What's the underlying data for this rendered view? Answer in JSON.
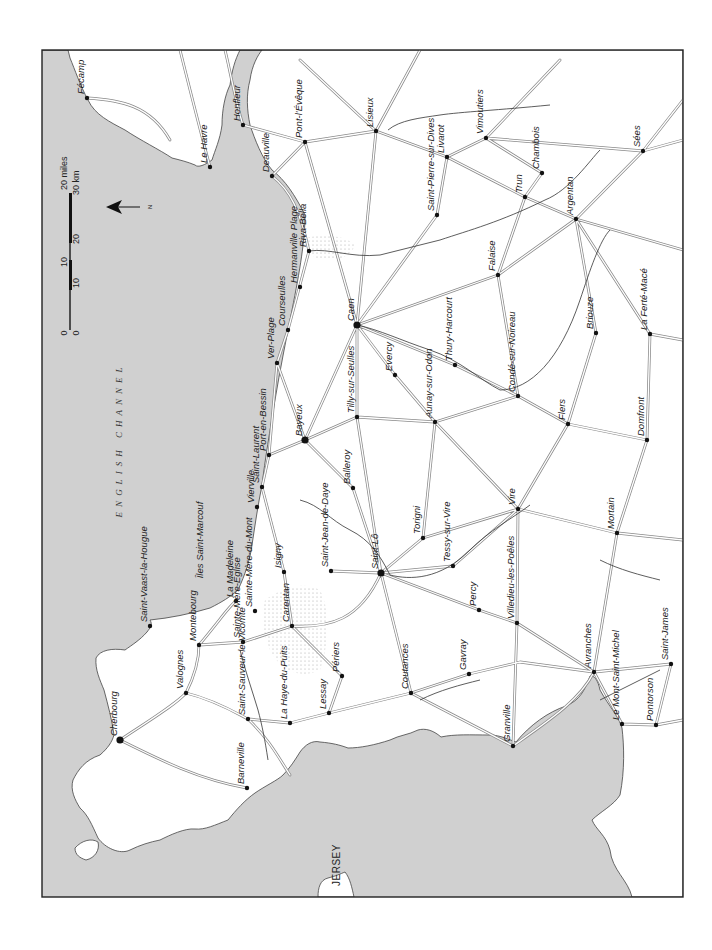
{
  "map": {
    "title": "Normandy",
    "orientation": "rotated 90 degrees; north arrow points left",
    "colors": {
      "sea": "#d0d0d0",
      "land": "#ffffff",
      "frame": "#222222",
      "road": "#8a8a8a",
      "river": "#333333"
    },
    "sea_label": "ENGLISH CHANNEL",
    "island_label": "JERSEY",
    "islands_small": "Îles Saint-Marcouf",
    "north_arrow": {
      "label": "N"
    },
    "scale_bar": {
      "miles_label": "20 miles",
      "km_label": "30 km",
      "miles_ticks": [
        "0",
        "10",
        "20"
      ],
      "km_ticks": [
        "0",
        "10",
        "20",
        "30"
      ]
    },
    "towns": [
      {
        "name": "Fécamp",
        "x": 87,
        "y": 98
      },
      {
        "name": "Le Havre",
        "x": 210,
        "y": 167
      },
      {
        "name": "Honfleur",
        "x": 243,
        "y": 125
      },
      {
        "name": "Deauville",
        "x": 272,
        "y": 176
      },
      {
        "name": "Pont-l'Évêque",
        "x": 305,
        "y": 142
      },
      {
        "name": "Lisieux",
        "x": 376,
        "y": 131
      },
      {
        "name": "Livarot",
        "x": 447,
        "y": 157
      },
      {
        "name": "Saint-Pierre-sur-Dives",
        "x": 437,
        "y": 215
      },
      {
        "name": "Vimoutiers",
        "x": 486,
        "y": 138
      },
      {
        "name": "Chambois",
        "x": 542,
        "y": 173
      },
      {
        "name": "Trun",
        "x": 525,
        "y": 197
      },
      {
        "name": "Sées",
        "x": 643,
        "y": 151
      },
      {
        "name": "Falaise",
        "x": 498,
        "y": 275
      },
      {
        "name": "Argentan",
        "x": 576,
        "y": 219
      },
      {
        "name": "Riva-Bella",
        "x": 309,
        "y": 251
      },
      {
        "name": "Hermanville Plage",
        "x": 300,
        "y": 287
      },
      {
        "name": "Courseulles",
        "x": 288,
        "y": 330
      },
      {
        "name": "Ver-Plage",
        "x": 277,
        "y": 363
      },
      {
        "name": "Caen",
        "x": 357,
        "y": 325
      },
      {
        "name": "Evercy",
        "x": 395,
        "y": 375
      },
      {
        "name": "Thury-Harcourt",
        "x": 455,
        "y": 365
      },
      {
        "name": "Aunay-sur-Odon",
        "x": 435,
        "y": 422
      },
      {
        "name": "Condé-sur-Noireau",
        "x": 518,
        "y": 396
      },
      {
        "name": "Briouze",
        "x": 596,
        "y": 333
      },
      {
        "name": "La Ferté-Macé",
        "x": 650,
        "y": 334
      },
      {
        "name": "Flers",
        "x": 568,
        "y": 424
      },
      {
        "name": "Domfront",
        "x": 647,
        "y": 440
      },
      {
        "name": "Tilly-sur-Seulles",
        "x": 357,
        "y": 417
      },
      {
        "name": "Port-en-Bessin",
        "x": 269,
        "y": 455
      },
      {
        "name": "Bayeux",
        "x": 305,
        "y": 440
      },
      {
        "name": "Balleroy",
        "x": 353,
        "y": 488
      },
      {
        "name": "Saint-Laurent",
        "x": 262,
        "y": 487
      },
      {
        "name": "Vierville",
        "x": 257,
        "y": 507
      },
      {
        "name": "Torigni",
        "x": 423,
        "y": 538
      },
      {
        "name": "Vire",
        "x": 518,
        "y": 509
      },
      {
        "name": "Tessy-sur-Vire",
        "x": 453,
        "y": 566
      },
      {
        "name": "Saint-Lô",
        "x": 381,
        "y": 573
      },
      {
        "name": "Saint-Jean-de-Daye",
        "x": 331,
        "y": 571
      },
      {
        "name": "Isigny",
        "x": 284,
        "y": 572
      },
      {
        "name": "Carentan",
        "x": 292,
        "y": 626
      },
      {
        "name": "La Madeleine",
        "x": 236,
        "y": 601
      },
      {
        "name": "Sainte-Mère-du-Mont",
        "x": 255,
        "y": 611
      },
      {
        "name": "Sainte-Mère-Église",
        "x": 243,
        "y": 642
      },
      {
        "name": "Mortain",
        "x": 617,
        "y": 533
      },
      {
        "name": "Percy",
        "x": 479,
        "y": 610
      },
      {
        "name": "Villedieu-les-Poêles",
        "x": 517,
        "y": 623
      },
      {
        "name": "Montebourg",
        "x": 199,
        "y": 645
      },
      {
        "name": "Saint-Vaast-la-Hougue",
        "x": 150,
        "y": 626
      },
      {
        "name": "Valognes",
        "x": 186,
        "y": 693
      },
      {
        "name": "Périers",
        "x": 342,
        "y": 676
      },
      {
        "name": "Coutances",
        "x": 411,
        "y": 693
      },
      {
        "name": "Gavray",
        "x": 469,
        "y": 674
      },
      {
        "name": "Avranches",
        "x": 594,
        "y": 672
      },
      {
        "name": "Saint-James",
        "x": 671,
        "y": 664
      },
      {
        "name": "Cherbourg",
        "x": 120,
        "y": 740
      },
      {
        "name": "Saint-Sauveur-le-Vicomte",
        "x": 248,
        "y": 719
      },
      {
        "name": "La Haye-du-Puits",
        "x": 290,
        "y": 723
      },
      {
        "name": "Lessay",
        "x": 329,
        "y": 713
      },
      {
        "name": "Granville",
        "x": 513,
        "y": 746
      },
      {
        "name": "Le Mont-Saint-Michel",
        "x": 622,
        "y": 724
      },
      {
        "name": "Pontorson",
        "x": 656,
        "y": 725
      },
      {
        "name": "Barneville",
        "x": 247,
        "y": 788
      }
    ],
    "rivers": [
      "Seine",
      "Touques",
      "Vie",
      "Dives",
      "Orne",
      "Laize",
      "Odon",
      "Seulles",
      "Aure",
      "Drôme",
      "Elle",
      "Vire",
      "Taute",
      "Douve",
      "Merderet",
      "Sienne",
      "Soulles",
      "Sée",
      "Sélune",
      "Varenne",
      "Terrette",
      "Ay",
      "Lozon"
    ]
  }
}
